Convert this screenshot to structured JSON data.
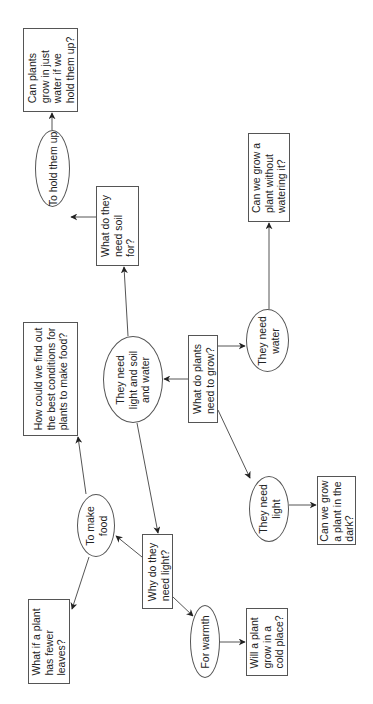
{
  "diagram": {
    "title": "",
    "orientation": "rotated -90deg",
    "colors": {
      "line": "#555555",
      "text": "#222222",
      "background": "#ffffff"
    },
    "nodes": {
      "q_water_hold": {
        "shape": "box",
        "text": "Can plants\ngrow in just\nwater if we\nhold them up?"
      },
      "a_hold_up": {
        "shape": "ellipse",
        "text": "To hold them up"
      },
      "q_soil_for": {
        "shape": "box",
        "text": "What do they\nneed soil\nfor?"
      },
      "q_no_water": {
        "shape": "box",
        "text": "Can we grow a\nplant without\nwatering it?"
      },
      "q_best_conditions": {
        "shape": "box",
        "text": "How could we find out\nthe best conditions for\nplants to make food?"
      },
      "a_light_soil_water": {
        "shape": "ellipse",
        "text": "They need\nlight and soil\nand water"
      },
      "q_root": {
        "shape": "box",
        "text": "What do plants\nneed to grow?"
      },
      "a_water": {
        "shape": "ellipse",
        "text": "They need\nwater"
      },
      "a_make_food": {
        "shape": "ellipse",
        "text": "To make\nfood"
      },
      "q_why_light": {
        "shape": "box",
        "text": "Why do they\nneed light?"
      },
      "a_light": {
        "shape": "ellipse",
        "text": "They need\nlight"
      },
      "q_dark": {
        "shape": "box",
        "text": "Can we grow\na plant in the\ndark?"
      },
      "q_fewer_leaves": {
        "shape": "box",
        "text": "What if a plant\nhas fewer\nleaves?"
      },
      "a_warmth": {
        "shape": "ellipse",
        "text": "For warmth"
      },
      "q_cold": {
        "shape": "box",
        "text": "Will a plant\ngrow in a\ncold place?"
      }
    },
    "edges": [
      {
        "from": "q_root",
        "to": "a_light_soil_water"
      },
      {
        "from": "q_root",
        "to": "a_water"
      },
      {
        "from": "q_root",
        "to": "a_light"
      },
      {
        "from": "a_water",
        "to": "q_no_water"
      },
      {
        "from": "a_light",
        "to": "q_dark"
      },
      {
        "from": "a_light_soil_water",
        "to": "q_soil_for"
      },
      {
        "from": "a_light_soil_water",
        "to": "q_why_light"
      },
      {
        "from": "q_soil_for",
        "to": "a_hold_up"
      },
      {
        "from": "a_hold_up",
        "to": "q_water_hold"
      },
      {
        "from": "q_why_light",
        "to": "a_make_food"
      },
      {
        "from": "q_why_light",
        "to": "a_warmth"
      },
      {
        "from": "a_make_food",
        "to": "q_best_conditions"
      },
      {
        "from": "a_make_food",
        "to": "q_fewer_leaves"
      },
      {
        "from": "a_warmth",
        "to": "q_cold"
      }
    ]
  }
}
